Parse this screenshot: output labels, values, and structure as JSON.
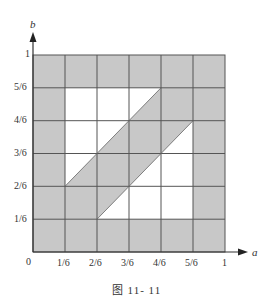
{
  "figure": {
    "caption": "图    11- 11",
    "x_axis_label": "a",
    "y_axis_label": "b",
    "origin_label": "0",
    "x_ticks": [
      "1/6",
      "2/6",
      "3/6",
      "4/6",
      "5/6",
      "1"
    ],
    "y_ticks": [
      "1/6",
      "2/6",
      "3/6",
      "4/6",
      "5/6",
      "1"
    ],
    "grid_divisions": 6,
    "colors": {
      "shade": "#c8c8c8",
      "line": "#555555",
      "background": "#ffffff"
    },
    "shaded_regions": [
      {
        "name": "outer-border-ring",
        "description": "all cells touching the unit square boundary"
      },
      {
        "name": "diagonal-band",
        "polygon": [
          [
            0.1667,
            0.3333
          ],
          [
            0.1667,
            0.1667
          ],
          [
            0.3333,
            0.1667
          ],
          [
            0.8333,
            0.6667
          ],
          [
            0.8333,
            0.8333
          ],
          [
            0.6667,
            0.8333
          ]
        ]
      }
    ]
  }
}
